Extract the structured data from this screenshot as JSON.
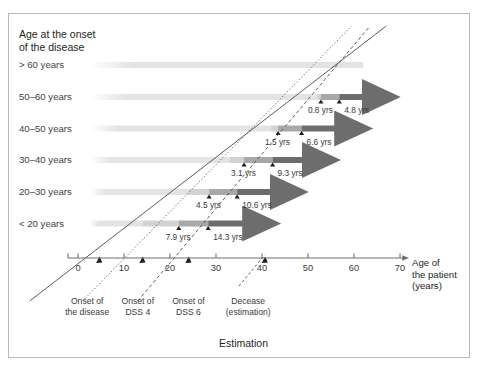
{
  "figure": {
    "legend_title": "Age at the onset\nof the disease",
    "caption": "Estimation",
    "axis_title": "Age of\nthe patient\n(years)"
  },
  "colors": {
    "band_light": "#e3e3e3",
    "seg_light": "#d2d2d2",
    "seg_mid": "#a8a8a8",
    "seg_dark": "#6d6d6d",
    "axis": "#6e6e6e",
    "text": "#3a3a3a",
    "frame": "#b9b9b9"
  },
  "chart_data": {
    "type": "bar",
    "title": "Estimation",
    "xlabel": "Age of the patient (years)",
    "ylabel": "Age at the onset of the disease",
    "xlim": [
      0,
      72
    ],
    "xticks": [
      0,
      10,
      20,
      30,
      40,
      50,
      60,
      70
    ],
    "xticklabels": [
      "0",
      "10",
      "20",
      "30",
      "40",
      "50",
      "60",
      "70"
    ],
    "grid": false,
    "legend": "none",
    "categories": [
      "> 60 years",
      "50–60 years",
      "40–50 years",
      "30–40 years",
      "20–30 years",
      "< 20 years"
    ],
    "markers": [
      {
        "name": "Onset of the disease",
        "style": "solid-line"
      },
      {
        "name": "Onset of DSS 4",
        "style": "dotted-line"
      },
      {
        "name": "Onset of DSS 6",
        "style": "dashed-line"
      },
      {
        "name": "Decease (estimation)",
        "style": "dash-dot-line"
      }
    ],
    "rows": [
      {
        "category": "> 60 years",
        "onset_age": 62.0,
        "dss4_label": "",
        "dss6_label": "",
        "dss4_offset": null,
        "dss6_offset": null,
        "band_end": 62.0,
        "arrow_end": null
      },
      {
        "category": "50–60 years",
        "onset_age": 52.0,
        "dss4_label": "0.8 yrs",
        "dss6_label": "4.8 yrs",
        "dss4_offset": 0.8,
        "dss6_offset": 4.8,
        "band_end": 52.0,
        "arrow_end": 64.0
      },
      {
        "category": "40–50 years",
        "onset_age": 42.0,
        "dss4_label": "1.5 yrs",
        "dss6_label": "6.6 yrs",
        "dss4_offset": 1.5,
        "dss6_offset": 6.6,
        "band_end": 42.0,
        "arrow_end": 58.0
      },
      {
        "category": "30–40 years",
        "onset_age": 33.0,
        "dss4_label": "3.1 yrs",
        "dss6_label": "9.3 yrs",
        "dss4_offset": 3.1,
        "dss6_offset": 9.3,
        "band_end": 33.0,
        "arrow_end": 51.0
      },
      {
        "category": "20–30 years",
        "onset_age": 24.0,
        "dss4_label": "4.5 yrs",
        "dss6_label": "10.6 yrs",
        "dss4_offset": 4.5,
        "dss6_offset": 10.6,
        "band_end": 24.0,
        "arrow_end": 44.0
      },
      {
        "category": "< 20 years",
        "onset_age": 14.0,
        "dss4_label": "7.9 yrs",
        "dss6_label": "14.3 yrs",
        "dss4_offset": 7.9,
        "dss6_offset": 14.3,
        "band_end": 14.0,
        "arrow_end": 38.0
      }
    ],
    "annotations": [
      {
        "text": "Onset of\nthe disease",
        "x": 2
      },
      {
        "text": "Onset of\nDSS 4",
        "x": 13
      },
      {
        "text": "Onset of\nDSS 6",
        "x": 24
      },
      {
        "text": "Decease\n(estimation)",
        "x": 37
      }
    ]
  }
}
